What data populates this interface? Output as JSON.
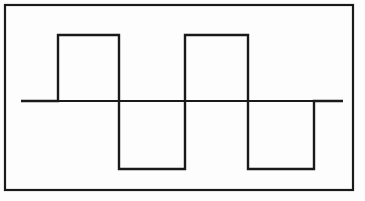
{
  "figure": {
    "background_color": "#fdfdfd",
    "line_color": "#1a1a1a",
    "frame": {
      "name": "outer-border",
      "x": 5,
      "y": 5,
      "width": 348,
      "height": 185,
      "stroke_width": 2.2,
      "color": "#1a1a1a"
    },
    "axis": {
      "name": "zero-baseline",
      "y": 101,
      "x_start": 21,
      "x_end": 343,
      "stroke_width": 2.2,
      "color": "#1a1a1a"
    },
    "wave": {
      "name": "square-wave",
      "stroke_width": 2.4,
      "color": "#1a1a1a",
      "high_y": 35,
      "low_y": 169,
      "zero_y": 101,
      "x_start": 21,
      "x_end": 343,
      "transitions": [
        58,
        119,
        185,
        248,
        314
      ],
      "path": "M 21 101 L 58 101 L 58 35 L 119 35 L 119 169 L 185 169 L 185 35 L 248 35 L 248 169 L 314 169 L 314 101 L 343 101"
    }
  },
  "chart_data": {
    "type": "line",
    "subtitle": "",
    "xlabel": "",
    "ylabel": "",
    "grid": false,
    "legend": "none",
    "xlim": [
      21,
      343
    ],
    "ylim": [
      -1,
      1
    ],
    "amplitude_high": 1,
    "amplitude_low": -1,
    "zero_level": 0,
    "pixel_levels": {
      "high_y": 35,
      "zero_y": 101,
      "low_y": 169
    },
    "transition_x_pixels": [
      58,
      119,
      185,
      248,
      314
    ],
    "series": [
      {
        "name": "square-wave",
        "x": [
          21,
          58,
          58,
          119,
          119,
          185,
          185,
          248,
          248,
          314,
          314,
          343
        ],
        "values": [
          0,
          0,
          1,
          1,
          -1,
          -1,
          1,
          1,
          -1,
          -1,
          0,
          0
        ]
      }
    ],
    "segments": [
      {
        "label": "lead-in-zero",
        "x_start": 21,
        "x_end": 58,
        "level": 0
      },
      {
        "label": "positive-pulse-1",
        "x_start": 58,
        "x_end": 119,
        "level": 1
      },
      {
        "label": "negative-pulse-1",
        "x_start": 119,
        "x_end": 185,
        "level": -1
      },
      {
        "label": "positive-pulse-2",
        "x_start": 185,
        "x_end": 248,
        "level": 1
      },
      {
        "label": "negative-pulse-2",
        "x_start": 248,
        "x_end": 314,
        "level": -1
      },
      {
        "label": "trail-out-zero",
        "x_start": 314,
        "x_end": 343,
        "level": 0
      }
    ],
    "annotations": []
  }
}
